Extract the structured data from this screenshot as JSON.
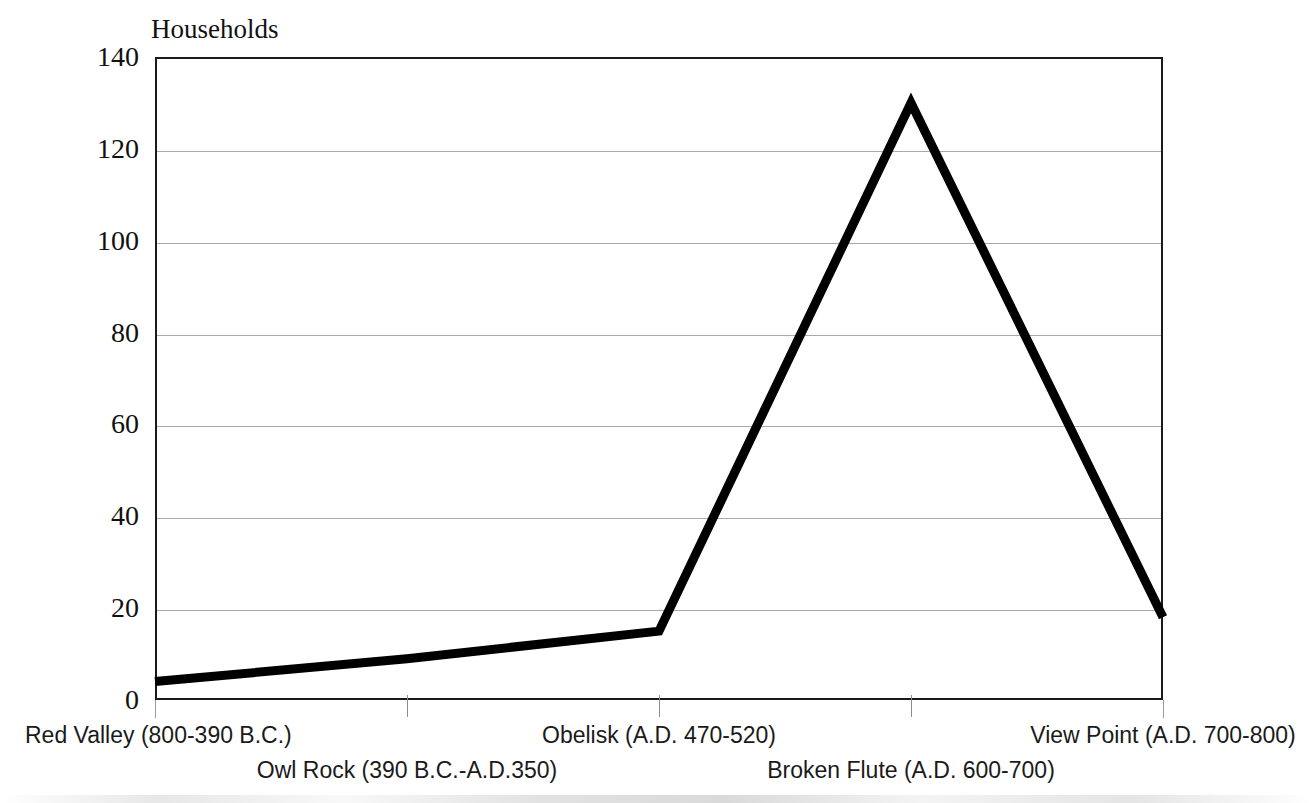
{
  "chart_data": {
    "type": "line",
    "title": "Households",
    "xlabel": "",
    "ylabel": "Households",
    "categories": [
      "Red Valley (800-390 B.C.)",
      "Owl Rock (390 B.C.-A.D.350)",
      "Obelisk (A.D. 470-520)",
      "Broken Flute (A.D. 600-700)",
      "View Point (A.D. 700-800)"
    ],
    "values": [
      4,
      9,
      15,
      130,
      18
    ],
    "series": [
      {
        "name": "Households",
        "values": [
          4,
          9,
          15,
          130,
          18
        ]
      }
    ],
    "ylim": [
      0,
      140
    ],
    "ytick_values": [
      140,
      120,
      100,
      80,
      60,
      40,
      20,
      0
    ],
    "ytick_labels": [
      "140",
      "120",
      "100",
      "80",
      "60",
      "40",
      "20",
      "0"
    ],
    "grid": "horizontal",
    "legend": "none",
    "line_color": "#000000",
    "line_width_px": 9,
    "gridline_color": "#a9a9a9",
    "axis_color": "#1a1a1a",
    "background_color": "#ffffff"
  },
  "axis_title": {
    "text": "Households"
  },
  "x_labels": [
    {
      "text": "Red Valley (800-390 B.C.)",
      "row": "a"
    },
    {
      "text": "Owl Rock (390 B.C.-A.D.350)",
      "row": "b"
    },
    {
      "text": "Obelisk (A.D. 470-520)",
      "row": "a"
    },
    {
      "text": "Broken Flute (A.D. 600-700)",
      "row": "b"
    },
    {
      "text": "View Point (A.D. 700-800)",
      "row": "a"
    }
  ]
}
